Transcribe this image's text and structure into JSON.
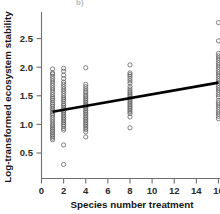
{
  "figure": {
    "panel_label_fragment": "b)",
    "width": 220,
    "height": 214,
    "background_color": "#ffffff"
  },
  "chart_data": {
    "type": "scatter",
    "title": "",
    "xlabel": "Species number treatment",
    "ylabel": "Log-transformed ecosystem stability",
    "xlim": [
      0,
      16.8
    ],
    "ylim": [
      0.18,
      2.88
    ],
    "xticks": [
      0,
      2,
      4,
      6,
      8,
      10,
      12,
      14,
      16
    ],
    "xticklabels": [
      "0",
      "2",
      "4",
      "6",
      "8",
      "10",
      "12",
      "14",
      "16"
    ],
    "yticks": [
      0.5,
      1.0,
      1.5,
      2.0,
      2.5
    ],
    "yticklabels": [
      "0.5",
      "1.0",
      "1.5",
      "2.0",
      "2.5"
    ],
    "grid": false,
    "legend": null,
    "marker": "open-circle",
    "marker_color": "#5a5a5a",
    "line_color": "#000000",
    "series": [
      {
        "name": "Species number 1",
        "x": 1,
        "values": [
          1.97,
          1.9,
          1.88,
          1.84,
          1.8,
          1.76,
          1.72,
          1.68,
          1.64,
          1.6,
          1.56,
          1.52,
          1.48,
          1.45,
          1.42,
          1.38,
          1.35,
          1.32,
          1.28,
          1.25,
          1.22,
          1.19,
          1.16,
          1.12,
          1.08,
          1.04,
          1.0,
          0.97,
          0.94,
          0.91,
          0.88,
          0.85,
          0.82,
          0.79,
          0.76,
          0.73
        ]
      },
      {
        "name": "Species number 2",
        "x": 2,
        "values": [
          1.98,
          1.93,
          1.86,
          1.8,
          1.74,
          1.7,
          1.66,
          1.62,
          1.58,
          1.54,
          1.5,
          1.46,
          1.43,
          1.4,
          1.36,
          1.33,
          1.3,
          1.27,
          1.24,
          1.21,
          1.18,
          1.15,
          1.12,
          1.09,
          1.06,
          1.03,
          1.0,
          0.97,
          0.93,
          0.9,
          0.64,
          0.3
        ]
      },
      {
        "name": "Species number 4",
        "x": 4,
        "values": [
          1.99,
          1.7,
          1.66,
          1.62,
          1.58,
          1.55,
          1.51,
          1.48,
          1.45,
          1.42,
          1.39,
          1.36,
          1.33,
          1.3,
          1.27,
          1.24,
          1.21,
          1.18,
          1.15,
          1.12,
          1.09,
          1.06,
          1.03,
          1.0,
          0.97,
          0.94,
          0.91,
          0.87,
          0.78
        ]
      },
      {
        "name": "Species number 8",
        "x": 8,
        "values": [
          2.04,
          1.9,
          1.87,
          1.84,
          1.8,
          1.76,
          1.72,
          1.66,
          1.62,
          1.58,
          1.55,
          1.52,
          1.49,
          1.46,
          1.43,
          1.4,
          1.37,
          1.34,
          1.31,
          1.28,
          1.25,
          1.22,
          1.19,
          1.13,
          0.94
        ]
      },
      {
        "name": "Species number 16",
        "x": 16,
        "values": [
          2.78,
          2.46,
          2.24,
          2.2,
          2.16,
          2.12,
          2.08,
          2.04,
          2.0,
          1.96,
          1.92,
          1.88,
          1.84,
          1.8,
          1.76,
          1.72,
          1.68,
          1.64,
          1.6,
          1.56,
          1.52,
          1.48,
          1.42,
          1.38,
          1.34,
          1.3,
          1.26,
          1.22,
          1.18,
          1.14,
          1.1
        ]
      }
    ],
    "fit_line": {
      "name": "regression-line",
      "x_start": 1,
      "y_start": 1.22,
      "x_end": 16,
      "y_end": 1.73
    }
  }
}
